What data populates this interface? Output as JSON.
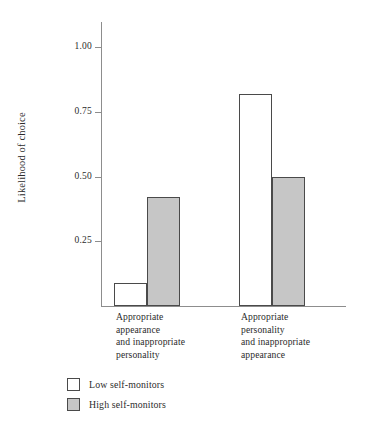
{
  "chart_data": {
    "type": "bar",
    "title": "",
    "subtitle": "",
    "xlabel": "",
    "ylabel": "Likelihood of choice",
    "ylim": [
      0,
      1.1
    ],
    "grid": false,
    "legend_position": "bottom-left",
    "categories": [
      "Appropriate\nappearance\nand inappropriate\npersonality",
      "Appropriate\npersonality\nand inappropriate\nappearance"
    ],
    "ytick_labels": [
      "1.00",
      "0.75",
      "0.50",
      "0.25"
    ],
    "ytick_values": [
      1.0,
      0.75,
      0.5,
      0.25
    ],
    "series": [
      {
        "name": "Low self-monitors",
        "values": [
          0.09,
          0.82
        ],
        "fill": "#ffffff",
        "edge": "#4a4a4a"
      },
      {
        "name": "High self-monitors",
        "values": [
          0.42,
          0.5
        ],
        "fill": "#c6c6c6",
        "edge": "#4a4a4a"
      }
    ]
  },
  "axis": {
    "color": "#8d8d8d"
  }
}
